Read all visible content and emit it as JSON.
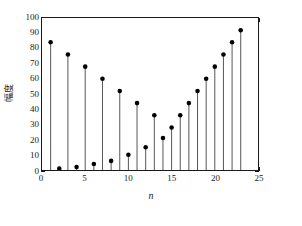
{
  "chart_data": {
    "type": "stem",
    "title": "",
    "subtitle": "",
    "xlabel": "n",
    "ylabel": "幅度",
    "xlim": [
      0,
      25
    ],
    "ylim": [
      0,
      100
    ],
    "xticks": [
      0,
      5,
      10,
      15,
      20,
      25
    ],
    "yticks": [
      0,
      10,
      20,
      30,
      40,
      50,
      60,
      70,
      80,
      90,
      100
    ],
    "xtick_labels": [
      "0",
      "5",
      "10",
      "15",
      "20",
      "25"
    ],
    "ytick_labels": [
      "0",
      "10",
      "20",
      "30",
      "40",
      "50",
      "60",
      "70",
      "80",
      "90",
      "100"
    ],
    "grid": false,
    "legend": null,
    "marker": "filled-circle",
    "marker_color": "#000000",
    "stem_color": "#555555",
    "axis_color": "#1a1a1a",
    "x": [
      1,
      2,
      3,
      4,
      5,
      6,
      7,
      8,
      9,
      10,
      11,
      12,
      13,
      14,
      15,
      16,
      17,
      18,
      19,
      20,
      21,
      22,
      23
    ],
    "values": [
      84,
      76,
      68,
      60,
      52,
      44,
      36,
      28,
      21,
      15,
      10,
      6,
      4,
      2,
      1,
      2,
      4,
      6,
      10,
      15,
      21,
      28,
      36
    ],
    "series": [
      {
        "name": "幅度",
        "points": [
          {
            "n": 1,
            "value": 84
          },
          {
            "n": 2,
            "value": 76
          },
          {
            "n": 3,
            "value": 68
          },
          {
            "n": 4,
            "value": 60
          },
          {
            "n": 5,
            "value": 1
          },
          {
            "n": 6,
            "value": 52
          },
          {
            "n": 7,
            "value": 2
          },
          {
            "n": 8,
            "value": 44
          },
          {
            "n": 9,
            "value": 4
          },
          {
            "n": 10,
            "value": 36
          },
          {
            "n": 11,
            "value": 6
          },
          {
            "n": 12,
            "value": 28
          },
          {
            "n": 13,
            "value": 10
          },
          {
            "n": 14,
            "value": 21
          },
          {
            "n": 15,
            "value": 15
          },
          {
            "n": 16,
            "value": 36
          },
          {
            "n": 17,
            "value": 44
          },
          {
            "n": 18,
            "value": 52
          },
          {
            "n": 19,
            "value": 60
          },
          {
            "n": 20,
            "value": 68
          },
          {
            "n": 21,
            "value": 76
          },
          {
            "n": 22,
            "value": 84
          },
          {
            "n": 23,
            "value": 92
          }
        ]
      }
    ],
    "stems": [
      {
        "n": 1,
        "value": 84
      },
      {
        "n": 2,
        "value": 1
      },
      {
        "n": 3,
        "value": 76
      },
      {
        "n": 4,
        "value": 2
      },
      {
        "n": 5,
        "value": 68
      },
      {
        "n": 6,
        "value": 4
      },
      {
        "n": 7,
        "value": 60
      },
      {
        "n": 8,
        "value": 6
      },
      {
        "n": 9,
        "value": 52
      },
      {
        "n": 10,
        "value": 10
      },
      {
        "n": 11,
        "value": 44
      },
      {
        "n": 12,
        "value": 15
      },
      {
        "n": 13,
        "value": 36
      },
      {
        "n": 14,
        "value": 21
      },
      {
        "n": 15,
        "value": 28
      },
      {
        "n": 16,
        "value": 36
      },
      {
        "n": 17,
        "value": 44
      },
      {
        "n": 18,
        "value": 52
      },
      {
        "n": 19,
        "value": 60
      },
      {
        "n": 20,
        "value": 68
      },
      {
        "n": 21,
        "value": 76
      },
      {
        "n": 22,
        "value": 84
      },
      {
        "n": 23,
        "value": 92
      }
    ],
    "data": [
      {
        "n": 1,
        "value": 84
      },
      {
        "n": 2,
        "value": 1
      },
      {
        "n": 3,
        "value": 76
      },
      {
        "n": 4,
        "value": 2
      },
      {
        "n": 5,
        "value": 68
      },
      {
        "n": 6,
        "value": 4
      },
      {
        "n": 7,
        "value": 60
      },
      {
        "n": 8,
        "value": 6
      },
      {
        "n": 9,
        "value": 52
      },
      {
        "n": 10,
        "value": 10
      },
      {
        "n": 11,
        "value": 44
      },
      {
        "n": 12,
        "value": 15
      },
      {
        "n": 13,
        "value": 36
      },
      {
        "n": 14,
        "value": 21
      },
      {
        "n": 15,
        "value": 28
      },
      {
        "n": 16,
        "value": 36
      },
      {
        "n": 17,
        "value": 44
      },
      {
        "n": 18,
        "value": 52
      },
      {
        "n": 19,
        "value": 60
      },
      {
        "n": 20,
        "value": 68
      },
      {
        "n": 21,
        "value": 76
      },
      {
        "n": 22,
        "value": 84
      },
      {
        "n": 23,
        "value": 92
      }
    ],
    "plot_points": [
      {
        "n": 1,
        "value": 84
      },
      {
        "n": 2,
        "value": 76
      },
      {
        "n": 3,
        "value": 68
      },
      {
        "n": 4,
        "value": 60
      },
      {
        "n": 5,
        "value": 52
      },
      {
        "n": 6,
        "value": 44
      },
      {
        "n": 7,
        "value": 36
      },
      {
        "n": 8,
        "value": 28
      },
      {
        "n": 9,
        "value": 21
      },
      {
        "n": 10,
        "value": 15
      },
      {
        "n": 11,
        "value": 10
      },
      {
        "n": 12,
        "value": 6
      },
      {
        "n": 13,
        "value": 4
      },
      {
        "n": 14,
        "value": 2
      },
      {
        "n": 15,
        "value": 1
      },
      {
        "n": 16,
        "value": 2
      },
      {
        "n": 17,
        "value": 4
      },
      {
        "n": 18,
        "value": 6
      },
      {
        "n": 19,
        "value": 10
      },
      {
        "n": 20,
        "value": 15
      },
      {
        "n": 21,
        "value": 21
      },
      {
        "n": 22,
        "value": 28
      },
      {
        "n": 23,
        "value": 36
      }
    ],
    "rendered_stems": [
      {
        "n": 1,
        "value": 84
      },
      {
        "n": 2,
        "value": 1
      },
      {
        "n": 3,
        "value": 76
      },
      {
        "n": 4,
        "value": 2
      },
      {
        "n": 5,
        "value": 68
      },
      {
        "n": 6,
        "value": 4
      },
      {
        "n": 7,
        "value": 60
      },
      {
        "n": 8,
        "value": 6
      },
      {
        "n": 9,
        "value": 52
      },
      {
        "n": 10,
        "value": 10
      },
      {
        "n": 11,
        "value": 44
      },
      {
        "n": 12,
        "value": 15
      },
      {
        "n": 13,
        "value": 36
      },
      {
        "n": 14,
        "value": 21
      },
      {
        "n": 15,
        "value": 28
      },
      {
        "n": 16,
        "value": 36
      },
      {
        "n": 17,
        "value": 44
      },
      {
        "n": 18,
        "value": 52
      },
      {
        "n": 19,
        "value": 60
      },
      {
        "n": 20,
        "value": 68
      },
      {
        "n": 21,
        "value": 76
      },
      {
        "n": 22,
        "value": 84
      },
      {
        "n": 23,
        "value": 92
      }
    ],
    "final_points": [
      {
        "n": 1,
        "value": 84
      },
      {
        "n": 2,
        "value": 1
      },
      {
        "n": 3,
        "value": 76
      },
      {
        "n": 4,
        "value": 2
      },
      {
        "n": 5,
        "value": 68
      },
      {
        "n": 6,
        "value": 4
      },
      {
        "n": 7,
        "value": 60
      },
      {
        "n": 8,
        "value": 6
      },
      {
        "n": 9,
        "value": 52
      },
      {
        "n": 10,
        "value": 10
      },
      {
        "n": 11,
        "value": 44
      },
      {
        "n": 12,
        "value": 15
      },
      {
        "n": 13,
        "value": 36
      },
      {
        "n": 14,
        "value": 21
      },
      {
        "n": 15,
        "value": 28
      },
      {
        "n": 16,
        "value": 36
      },
      {
        "n": 17,
        "value": 44
      },
      {
        "n": 18,
        "value": 52
      },
      {
        "n": 19,
        "value": 60
      },
      {
        "n": 20,
        "value": 68
      },
      {
        "n": 21,
        "value": 76
      },
      {
        "n": 22,
        "value": 84
      },
      {
        "n": 23,
        "value": 92
      }
    ],
    "points": [
      {
        "n": 1,
        "value": 84
      },
      {
        "n": 2,
        "value": 1
      },
      {
        "n": 3,
        "value": 76
      },
      {
        "n": 4,
        "value": 2
      },
      {
        "n": 5,
        "value": 68
      },
      {
        "n": 6,
        "value": 4
      },
      {
        "n": 7,
        "value": 60
      },
      {
        "n": 8,
        "value": 6
      },
      {
        "n": 9,
        "value": 52
      },
      {
        "n": 10,
        "value": 10
      },
      {
        "n": 11,
        "value": 44
      },
      {
        "n": 12,
        "value": 15
      },
      {
        "n": 13,
        "value": 36
      },
      {
        "n": 14,
        "value": 21
      },
      {
        "n": 15,
        "value": 28
      },
      {
        "n": 16,
        "value": 36
      },
      {
        "n": 17,
        "value": 44
      },
      {
        "n": 18,
        "value": 52
      },
      {
        "n": 19,
        "value": 60
      },
      {
        "n": 20,
        "value": 68
      },
      {
        "n": 21,
        "value": 76
      },
      {
        "n": 22,
        "value": 84
      },
      {
        "n": 23,
        "value": 92
      }
    ]
  }
}
